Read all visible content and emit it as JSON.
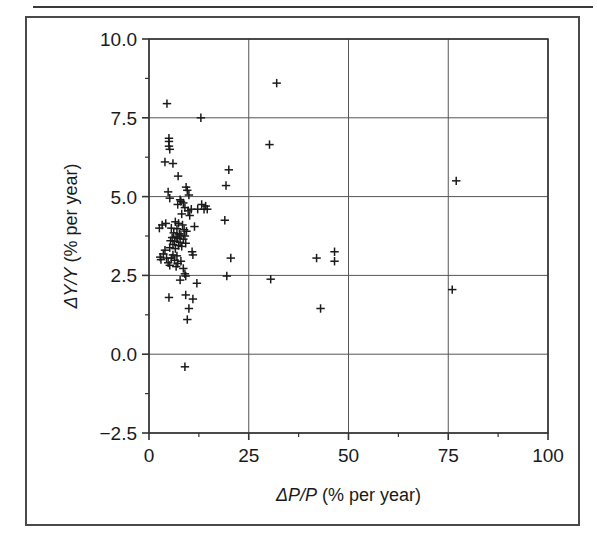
{
  "figure": {
    "has_top_rule": true,
    "has_outer_frame": true,
    "frame_color": "#4a4a4a",
    "background": "#ffffff"
  },
  "chart_data": {
    "type": "scatter",
    "title": "",
    "xlabel": "ΔP/P (% per year)",
    "ylabel": "ΔY/Y (% per year)",
    "xlim": [
      0,
      100
    ],
    "ylim": [
      -2.5,
      10.0
    ],
    "xticks": [
      0,
      25,
      50,
      75,
      100
    ],
    "yticks": [
      -2.5,
      0.0,
      2.5,
      5.0,
      7.5,
      10.0
    ],
    "xticklabels": [
      "0",
      "25",
      "50",
      "75",
      "100"
    ],
    "yticklabels": [
      "-2.5",
      "0.0",
      "2.5",
      "5.0",
      "7.5",
      "10.0"
    ],
    "minor_xticks": [
      12.5,
      37.5,
      62.5,
      87.5
    ],
    "minor_yticks": [
      -1.25,
      1.25,
      3.75,
      6.25,
      8.75
    ],
    "grid": true,
    "grid_color": "#555555",
    "marker": "plus",
    "marker_color": "#1a1a1a",
    "legend": null,
    "points": [
      [
        32.0,
        8.6
      ],
      [
        4.5,
        7.95
      ],
      [
        13.0,
        7.5
      ],
      [
        30.2,
        6.65
      ],
      [
        5.0,
        6.85
      ],
      [
        5.0,
        6.75
      ],
      [
        5.0,
        6.6
      ],
      [
        5.2,
        6.5
      ],
      [
        4.0,
        6.1
      ],
      [
        6.0,
        6.05
      ],
      [
        20.0,
        5.85
      ],
      [
        7.3,
        5.65
      ],
      [
        77.0,
        5.5
      ],
      [
        19.3,
        5.35
      ],
      [
        9.3,
        5.3
      ],
      [
        9.6,
        5.2
      ],
      [
        4.8,
        5.15
      ],
      [
        10.0,
        5.05
      ],
      [
        5.2,
        4.95
      ],
      [
        7.8,
        4.9
      ],
      [
        8.0,
        4.85
      ],
      [
        8.6,
        4.8
      ],
      [
        7.2,
        4.75
      ],
      [
        13.2,
        4.75
      ],
      [
        14.2,
        4.7
      ],
      [
        9.0,
        4.65
      ],
      [
        10.6,
        4.6
      ],
      [
        12.2,
        4.6
      ],
      [
        13.8,
        4.6
      ],
      [
        14.6,
        4.6
      ],
      [
        9.8,
        4.55
      ],
      [
        8.2,
        4.45
      ],
      [
        10.2,
        4.4
      ],
      [
        19.0,
        4.25
      ],
      [
        4.2,
        4.15
      ],
      [
        3.3,
        4.1
      ],
      [
        6.6,
        4.2
      ],
      [
        7.4,
        4.15
      ],
      [
        8.4,
        4.1
      ],
      [
        11.4,
        4.05
      ],
      [
        2.6,
        4.0
      ],
      [
        5.6,
        4.0
      ],
      [
        7.0,
        3.98
      ],
      [
        8.8,
        3.95
      ],
      [
        9.4,
        3.9
      ],
      [
        6.2,
        3.85
      ],
      [
        7.6,
        3.82
      ],
      [
        8.0,
        3.78
      ],
      [
        9.0,
        3.75
      ],
      [
        6.8,
        3.72
      ],
      [
        5.8,
        3.7
      ],
      [
        7.2,
        3.68
      ],
      [
        8.6,
        3.65
      ],
      [
        5.4,
        3.6
      ],
      [
        6.4,
        3.58
      ],
      [
        7.8,
        3.55
      ],
      [
        9.2,
        3.52
      ],
      [
        6.0,
        3.48
      ],
      [
        7.4,
        3.45
      ],
      [
        8.2,
        3.42
      ],
      [
        5.2,
        3.38
      ],
      [
        6.6,
        3.35
      ],
      [
        4.0,
        3.3
      ],
      [
        10.8,
        3.25
      ],
      [
        46.5,
        3.25
      ],
      [
        3.6,
        3.18
      ],
      [
        6.0,
        3.15
      ],
      [
        7.0,
        3.12
      ],
      [
        11.0,
        3.15
      ],
      [
        2.8,
        3.08
      ],
      [
        4.4,
        3.05
      ],
      [
        5.6,
        3.05
      ],
      [
        20.5,
        3.05
      ],
      [
        42.0,
        3.05
      ],
      [
        3.0,
        3.0
      ],
      [
        6.4,
        2.98
      ],
      [
        8.0,
        2.95
      ],
      [
        46.5,
        2.95
      ],
      [
        4.8,
        2.9
      ],
      [
        7.2,
        2.88
      ],
      [
        5.2,
        2.82
      ],
      [
        6.8,
        2.78
      ],
      [
        8.6,
        2.72
      ],
      [
        9.0,
        2.55
      ],
      [
        9.2,
        2.48
      ],
      [
        19.5,
        2.48
      ],
      [
        30.5,
        2.38
      ],
      [
        7.8,
        2.35
      ],
      [
        12.0,
        2.25
      ],
      [
        76.0,
        2.05
      ],
      [
        5.0,
        1.8
      ],
      [
        9.2,
        1.88
      ],
      [
        11.0,
        1.75
      ],
      [
        43.0,
        1.45
      ],
      [
        10.0,
        1.45
      ],
      [
        9.6,
        1.1
      ],
      [
        9.0,
        -0.4
      ]
    ]
  },
  "axes": {
    "x_title": "ΔP/P (% per year)",
    "y_title": "ΔY/Y (% per year)"
  }
}
